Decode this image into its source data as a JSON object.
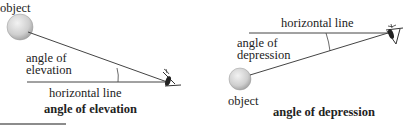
{
  "left": {
    "object_label": "object",
    "angle_label_line1": "angle of",
    "angle_label_line2": "elevation",
    "horizontal_label": "horizontal line",
    "caption": "angle of elevation"
  },
  "right": {
    "object_label": "object",
    "angle_label_line1": "angle of",
    "angle_label_line2": "depression",
    "horizontal_label": "horizontal line",
    "caption": "angle of depression"
  }
}
